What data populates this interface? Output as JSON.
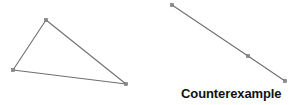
{
  "figure": {
    "width": 291,
    "height": 105,
    "background_color": "#ffffff",
    "stroke_color": "#6f6f73",
    "vertex_fill_color": "#8a8a8e",
    "vertex_stroke_color": "#6f6f73",
    "stroke_width": 1.1,
    "vertex_size": 3.2
  },
  "shapes": [
    {
      "id": "valid-triangle",
      "kind": "triangle",
      "label": "",
      "vertices": [
        {
          "name": "apex-vertex",
          "x": 46,
          "y": 20
        },
        {
          "name": "left-vertex",
          "x": 13,
          "y": 70
        },
        {
          "name": "right-vertex",
          "x": 126,
          "y": 84
        }
      ],
      "edges": [
        {
          "name": "edge-apex-left",
          "from": 0,
          "to": 1
        },
        {
          "name": "edge-left-right",
          "from": 1,
          "to": 2
        },
        {
          "name": "edge-right-apex",
          "from": 2,
          "to": 0
        }
      ]
    },
    {
      "id": "degenerate-triangle",
      "kind": "collinear-segment",
      "label": "Counterexample",
      "vertices": [
        {
          "name": "segment-start-vertex",
          "x": 172,
          "y": 5
        },
        {
          "name": "segment-middle-vertex",
          "x": 248,
          "y": 56
        },
        {
          "name": "segment-end-vertex",
          "x": 285,
          "y": 81
        }
      ],
      "edges": [
        {
          "name": "segment-upper-half",
          "from": 0,
          "to": 1
        },
        {
          "name": "segment-lower-half",
          "from": 1,
          "to": 2
        }
      ]
    }
  ],
  "captions": {
    "counterexample": "Counterexample"
  }
}
